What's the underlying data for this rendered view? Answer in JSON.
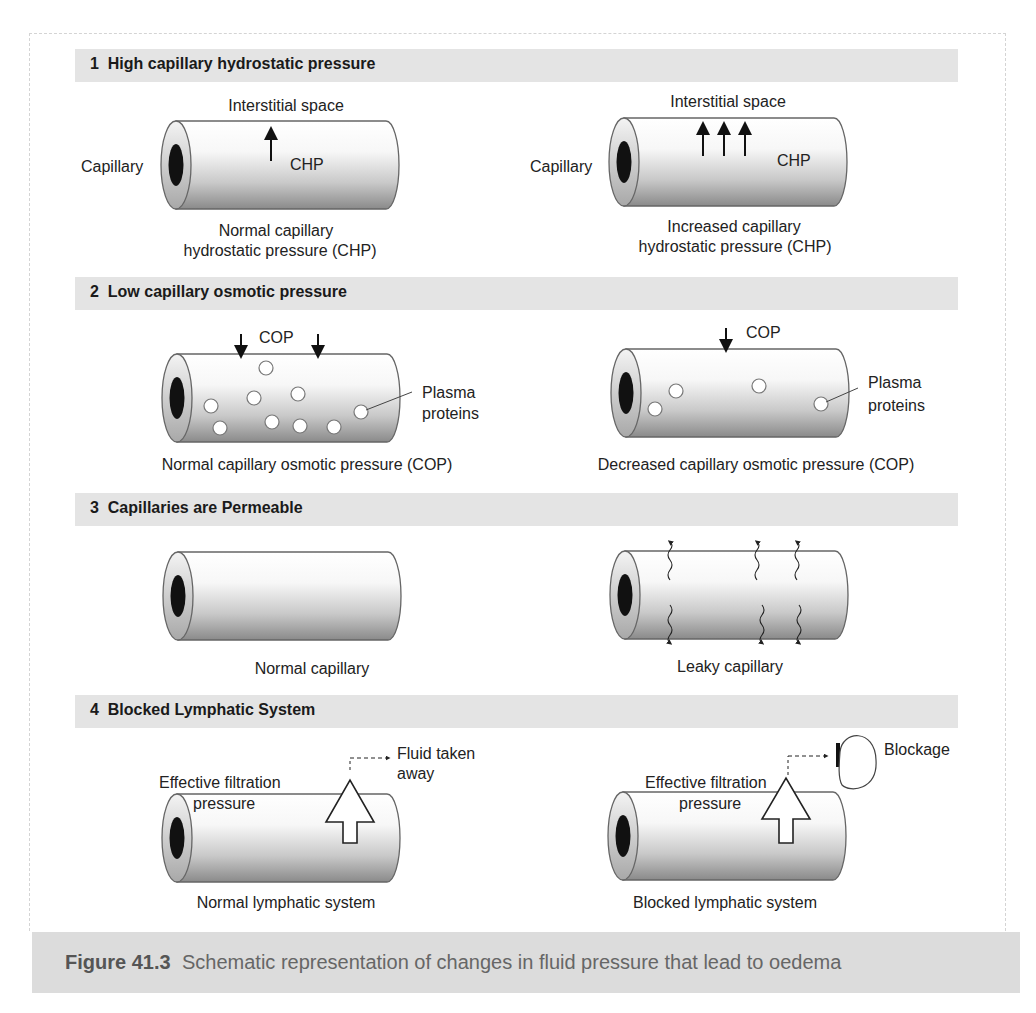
{
  "figure": {
    "caption_number": "Figure 41.3",
    "caption_text": "Schematic representation of changes in fluid pressure that lead to oedema"
  },
  "sections": [
    {
      "header": "1  High capillary hydrostatic pressure",
      "left": {
        "top_label": "Interstitial space",
        "side_label": "Capillary",
        "inner_label": "CHP",
        "arrows_up": 1,
        "caption_line1": "Normal capillary",
        "caption_line2": "hydrostatic pressure (CHP)"
      },
      "right": {
        "top_label": "Interstitial space",
        "side_label": "Capillary",
        "inner_label": "CHP",
        "arrows_up": 3,
        "caption_line1": "Increased capillary",
        "caption_line2": "hydrostatic pressure (CHP)"
      }
    },
    {
      "header": "2  Low capillary osmotic pressure",
      "left": {
        "top_label": "COP",
        "arrows_down": 2,
        "plasma_protein_count": 10,
        "pointer_label_line1": "Plasma",
        "pointer_label_line2": "proteins",
        "caption": "Normal capillary osmotic pressure (COP)"
      },
      "right": {
        "top_label": "COP",
        "arrows_down": 1,
        "plasma_protein_count": 4,
        "pointer_label_line1": "Plasma",
        "pointer_label_line2": "proteins",
        "caption": "Decreased capillary osmotic pressure (COP)"
      }
    },
    {
      "header": "3  Capillaries are Permeable",
      "left": {
        "caption": "Normal capillary"
      },
      "right": {
        "caption": "Leaky capillary",
        "leak_arrows": 6
      }
    },
    {
      "header": "4  Blocked Lymphatic System",
      "left": {
        "pressure_line1": "Effective filtration",
        "pressure_line2": "pressure",
        "flow_line1": "Fluid taken",
        "flow_line2": "away",
        "caption": "Normal lymphatic system"
      },
      "right": {
        "pressure_line1": "Effective filtration",
        "pressure_line2": "pressure",
        "blockage_label": "Blockage",
        "caption": "Blocked lymphatic system"
      }
    }
  ],
  "colors": {
    "band": "#e4e4e4",
    "caption_band": "#dcdcdc",
    "lumen": "#111111",
    "outline": "#555555"
  }
}
